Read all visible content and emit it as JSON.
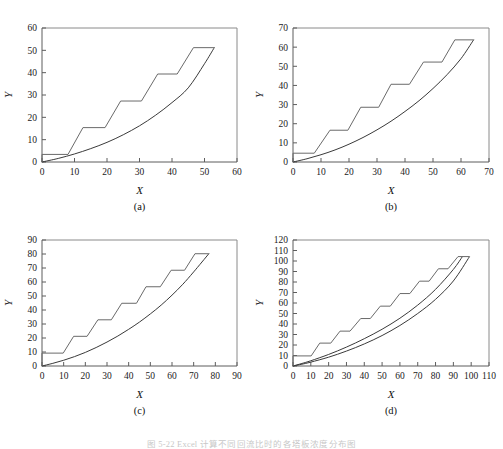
{
  "figure": {
    "caption": "图 5-22   Excel 计算不同回流比时的各塔板浓度分布图",
    "panels_label_a": "(a)",
    "panels_label_b": "(b)",
    "panels_label_c": "(c)",
    "panels_label_d": "(d)",
    "xlabel": "X",
    "ylabel": "Y",
    "colors": {
      "curve": "#3a3a3a",
      "stairs": "#6a6a6a",
      "axis": "#5d5d5d",
      "frame": "#8a8a8a",
      "background": "#ffffff"
    }
  },
  "chart_data": [
    {
      "type": "line",
      "panel": "a",
      "title": "",
      "xlabel": "X",
      "ylabel": "Y",
      "xlim": [
        0,
        60
      ],
      "ylim": [
        0,
        60
      ],
      "xticks": [
        0,
        10,
        20,
        30,
        40,
        50,
        60
      ],
      "yticks": [
        0,
        10,
        20,
        30,
        40,
        50,
        60
      ],
      "grid": false,
      "legend": "none",
      "series": [
        {
          "name": "equilibrium-curve",
          "x": [
            0,
            5,
            10,
            15,
            20,
            25,
            30,
            35,
            40,
            45,
            50,
            53
          ],
          "y": [
            0,
            1.6,
            3.6,
            6.0,
            8.8,
            12.2,
            16.2,
            21.0,
            26.6,
            33.2,
            44.0,
            51.2
          ]
        },
        {
          "name": "staircase",
          "x": [
            0,
            0,
            8.0,
            8.0,
            12.6,
            12.6,
            19.4,
            19.4,
            24.2,
            24.2,
            30.6,
            30.6,
            35.6,
            35.6,
            41.6,
            41.6,
            46.6,
            46.6,
            53.0
          ],
          "y": [
            0,
            3.4,
            3.4,
            3.4,
            15.4,
            15.4,
            15.4,
            15.4,
            27.3,
            27.3,
            27.3,
            27.3,
            39.4,
            39.4,
            39.4,
            39.4,
            51.2,
            51.2,
            51.2
          ]
        }
      ]
    },
    {
      "type": "line",
      "panel": "b",
      "title": "",
      "xlabel": "X",
      "ylabel": "Y",
      "xlim": [
        0,
        70
      ],
      "ylim": [
        0,
        70
      ],
      "xticks": [
        0,
        10,
        20,
        30,
        40,
        50,
        60,
        70
      ],
      "yticks": [
        0,
        10,
        20,
        30,
        40,
        50,
        60,
        70
      ],
      "grid": false,
      "legend": "none",
      "series": [
        {
          "name": "equilibrium-curve",
          "x": [
            0,
            5,
            10,
            15,
            20,
            25,
            30,
            35,
            40,
            45,
            50,
            55,
            60,
            64.5
          ],
          "y": [
            0,
            1.7,
            3.8,
            6.3,
            9.3,
            12.8,
            16.8,
            21.3,
            26.4,
            32.0,
            38.4,
            45.6,
            54.0,
            63.8
          ]
        },
        {
          "name": "staircase",
          "x": [
            0,
            0,
            7.6,
            7.6,
            13.2,
            13.2,
            19.6,
            19.6,
            24.2,
            24.2,
            30.6,
            30.6,
            35.0,
            35.0,
            41.6,
            41.6,
            46.6,
            46.6,
            53.2,
            53.2,
            57.8,
            57.8,
            64.5
          ],
          "y": [
            0,
            4.6,
            4.6,
            4.6,
            16.6,
            16.6,
            16.6,
            16.6,
            28.6,
            28.6,
            28.6,
            28.6,
            40.6,
            40.6,
            40.6,
            40.6,
            52.2,
            52.2,
            52.2,
            52.2,
            63.8,
            63.8,
            63.8
          ]
        }
      ]
    },
    {
      "type": "line",
      "panel": "c",
      "title": "",
      "xlabel": "X",
      "ylabel": "Y",
      "xlim": [
        0,
        90
      ],
      "ylim": [
        0,
        90
      ],
      "xticks": [
        0,
        10,
        20,
        30,
        40,
        50,
        60,
        70,
        80,
        90
      ],
      "yticks": [
        0,
        10,
        20,
        30,
        40,
        50,
        60,
        70,
        80,
        90
      ],
      "grid": false,
      "legend": "none",
      "series": [
        {
          "name": "equilibrium-curve",
          "x": [
            0,
            5,
            10,
            15,
            20,
            25,
            30,
            35,
            40,
            45,
            50,
            55,
            60,
            65,
            70,
            77
          ],
          "y": [
            0,
            1.9,
            4.1,
            6.7,
            9.7,
            13.2,
            17.1,
            21.4,
            26.2,
            31.4,
            37.2,
            43.5,
            50.6,
            58.4,
            67.2,
            80.2
          ]
        },
        {
          "name": "staircase",
          "x": [
            0,
            0,
            9.8,
            9.8,
            14.6,
            14.6,
            20.8,
            20.8,
            25.8,
            25.8,
            32.0,
            32.0,
            36.8,
            36.8,
            43.6,
            43.6,
            48.0,
            48.0,
            54.6,
            54.6,
            59.6,
            59.6,
            65.8,
            65.8,
            70.6,
            70.6,
            77.0
          ],
          "y": [
            0,
            9.2,
            9.2,
            9.2,
            21.2,
            21.2,
            21.2,
            21.2,
            33.0,
            33.0,
            33.0,
            33.0,
            44.8,
            44.8,
            44.8,
            44.8,
            56.6,
            56.6,
            56.6,
            56.6,
            68.4,
            68.4,
            68.4,
            68.4,
            80.2,
            80.2,
            80.2
          ]
        }
      ]
    },
    {
      "type": "line",
      "panel": "d",
      "title": "",
      "xlabel": "X",
      "ylabel": "Y",
      "xlim": [
        0,
        110
      ],
      "ylim": [
        0,
        120
      ],
      "xticks": [
        0,
        10,
        20,
        30,
        40,
        50,
        60,
        70,
        80,
        90,
        100,
        110
      ],
      "yticks": [
        0,
        10,
        20,
        30,
        40,
        50,
        60,
        70,
        80,
        90,
        100,
        110,
        120
      ],
      "grid": false,
      "legend": "none",
      "series": [
        {
          "name": "equilibrium-curve-upper",
          "x": [
            0,
            5,
            10,
            20,
            30,
            40,
            50,
            60,
            70,
            80,
            90,
            95
          ],
          "y": [
            0,
            2.4,
            5.0,
            11.0,
            18.0,
            26.0,
            35.0,
            45.5,
            58.0,
            73.0,
            92.0,
            104.0
          ]
        },
        {
          "name": "equilibrium-curve-lower",
          "x": [
            0,
            5,
            10,
            20,
            30,
            40,
            50,
            60,
            70,
            80,
            90,
            99
          ],
          "y": [
            0,
            1.7,
            3.7,
            8.4,
            14.2,
            21.0,
            29.0,
            38.6,
            50.0,
            63.5,
            81.0,
            104.0
          ]
        },
        {
          "name": "staircase",
          "x": [
            0,
            0,
            10.2,
            10.2,
            15.0,
            15.0,
            21.2,
            21.2,
            26.4,
            26.4,
            32.0,
            32.0,
            38.0,
            38.0,
            43.4,
            43.4,
            49.0,
            49.0,
            54.6,
            54.6,
            60.0,
            60.0,
            65.6,
            65.6,
            71.0,
            71.0,
            76.4,
            76.4,
            81.6,
            81.6,
            87.0,
            87.0,
            92.6,
            92.6,
            99.0
          ],
          "y": [
            0,
            9.6,
            9.6,
            9.6,
            21.8,
            21.8,
            21.8,
            21.8,
            33.2,
            33.2,
            33.2,
            33.2,
            45.2,
            45.2,
            45.2,
            45.2,
            57.0,
            57.0,
            57.0,
            57.0,
            69.0,
            69.0,
            69.0,
            69.0,
            80.8,
            80.8,
            80.8,
            80.8,
            92.6,
            92.6,
            92.6,
            92.6,
            104.2,
            104.2,
            104.2
          ]
        }
      ]
    }
  ]
}
